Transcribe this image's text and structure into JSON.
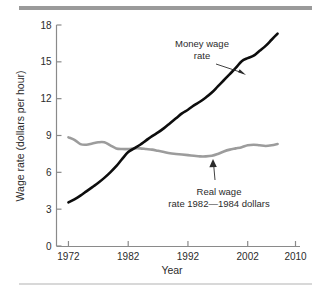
{
  "chart_data": {
    "type": "line",
    "title": "",
    "xlabel": "Year",
    "ylabel": "Wage rate (dollars per hour)",
    "xlim": [
      1970,
      2010
    ],
    "ylim": [
      0,
      18
    ],
    "xticks": [
      1972,
      1982,
      1992,
      2002,
      2010
    ],
    "xtick_labels": [
      "1972",
      "1982",
      "1992",
      "2002",
      "2010"
    ],
    "yticks": [
      0,
      3,
      6,
      9,
      12,
      15,
      18
    ],
    "ytick_labels": [
      "0",
      "3",
      "6",
      "9",
      "12",
      "15",
      "18"
    ],
    "grid": false,
    "legend_position": "inline-annotations",
    "series": [
      {
        "name": "Money wage rate",
        "color": "#0d0d0d",
        "x": [
          1972,
          1973,
          1974,
          1975,
          1976,
          1977,
          1978,
          1979,
          1980,
          1981,
          1982,
          1983,
          1984,
          1985,
          1986,
          1987,
          1988,
          1989,
          1990,
          1991,
          1992,
          1993,
          1994,
          1995,
          1996,
          1997,
          1998,
          1999,
          2000,
          2001,
          2002,
          2003,
          2004,
          2005,
          2006,
          2007
        ],
        "values": [
          3.55,
          3.8,
          4.1,
          4.45,
          4.8,
          5.15,
          5.55,
          6.0,
          6.5,
          7.1,
          7.65,
          7.95,
          8.25,
          8.6,
          8.95,
          9.25,
          9.6,
          10.0,
          10.4,
          10.8,
          11.1,
          11.45,
          11.75,
          12.1,
          12.5,
          13.0,
          13.5,
          14.0,
          14.5,
          15.05,
          15.3,
          15.5,
          15.9,
          16.3,
          16.8,
          17.3
        ]
      },
      {
        "name": "Real wage rate 1982—1984 dollars",
        "color": "#9c9c9c",
        "x": [
          1972,
          1973,
          1974,
          1975,
          1976,
          1977,
          1978,
          1979,
          1980,
          1981,
          1982,
          1983,
          1984,
          1985,
          1986,
          1987,
          1988,
          1989,
          1990,
          1991,
          1992,
          1993,
          1994,
          1995,
          1996,
          1997,
          1998,
          1999,
          2000,
          2001,
          2002,
          2003,
          2004,
          2005,
          2006,
          2007
        ],
        "values": [
          8.85,
          8.65,
          8.3,
          8.25,
          8.35,
          8.45,
          8.45,
          8.2,
          7.95,
          7.9,
          7.9,
          7.95,
          7.95,
          7.9,
          7.85,
          7.75,
          7.65,
          7.55,
          7.5,
          7.45,
          7.4,
          7.35,
          7.3,
          7.3,
          7.35,
          7.5,
          7.7,
          7.85,
          7.95,
          8.05,
          8.2,
          8.25,
          8.2,
          8.15,
          8.2,
          8.3
        ]
      }
    ],
    "annotations": [
      {
        "id": "money-wage-annotation",
        "line1": "Money wage",
        "line2": "rate",
        "points_to_series": "Money wage rate"
      },
      {
        "id": "real-wage-annotation",
        "line1": "Real wage",
        "line2": "rate 1982—1984 dollars",
        "points_to_series": "Real wage rate 1982—1984 dollars"
      }
    ],
    "colors": {
      "money_wage": "#0d0d0d",
      "real_wage": "#9c9c9c",
      "axis": "#8a8a8a",
      "text": "#2b2b2b",
      "rule_top": "#9a9a9a",
      "rule_bottom": "#d8d8d8",
      "background": "#ffffff"
    }
  }
}
